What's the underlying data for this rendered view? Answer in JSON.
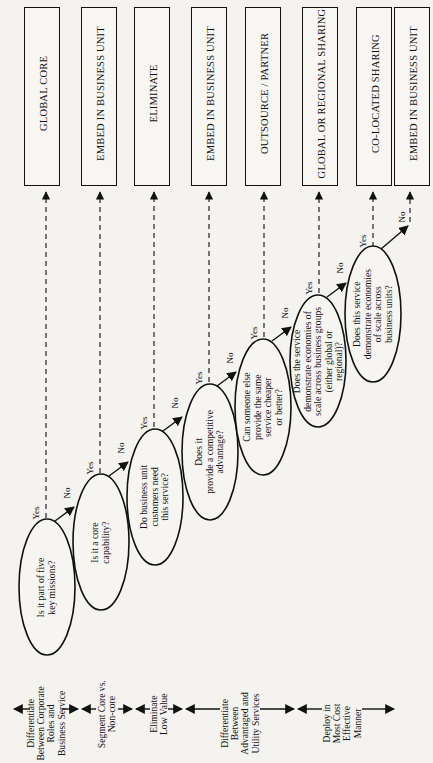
{
  "diagram": {
    "orientation": "rotated 90deg counter-clockwise",
    "outcomes": [
      {
        "id": "o1",
        "label": "GLOBAL CORE"
      },
      {
        "id": "o2",
        "label": "EMBED IN BUSINESS UNIT"
      },
      {
        "id": "o3",
        "label": "ELIMINATE"
      },
      {
        "id": "o4",
        "label": "EMBED IN BUSINESS UNIT"
      },
      {
        "id": "o5",
        "label": "OUTSOURCE / PARTNER"
      },
      {
        "id": "o6",
        "label": "GLOBAL OR REGIONAL SHARING"
      },
      {
        "id": "o7",
        "label": "CO-LOCATED SHARING"
      },
      {
        "id": "o8",
        "label": "EMBED IN BUSINESS UNIT"
      }
    ],
    "questions": [
      {
        "id": "q1",
        "lines": [
          "Is it part of five",
          "key missions?"
        ],
        "yes": "Yes",
        "no": "No"
      },
      {
        "id": "q2",
        "lines": [
          "Is it a core",
          "capability?"
        ],
        "yes": "Yes",
        "no": "No"
      },
      {
        "id": "q3",
        "lines": [
          "Do business unit",
          "customers need",
          "this service?"
        ],
        "yes": "Yes",
        "no": "No"
      },
      {
        "id": "q4",
        "lines": [
          "Does it",
          "provide a competitive",
          "advantage?"
        ],
        "yes": "Yes",
        "no": "No"
      },
      {
        "id": "q5",
        "lines": [
          "Can someone else",
          "provide the same",
          "service cheaper",
          "or better?"
        ],
        "yes": "Yes",
        "no": "No"
      },
      {
        "id": "q6",
        "lines": [
          "Does the service",
          "demonstrate economies of",
          "scale across business groups",
          "(either global or",
          "regional)?"
        ],
        "yes": "Yes",
        "no": "No"
      },
      {
        "id": "q7",
        "lines": [
          "Does this service",
          "demonstrate economies",
          "of scale across",
          "business units?"
        ],
        "yes": "Yes",
        "no": "No"
      }
    ],
    "phases": [
      {
        "id": "p1",
        "lines": [
          "Differentiate",
          "Between Corporate",
          "Roles and",
          "Business Service"
        ]
      },
      {
        "id": "p2",
        "lines": [
          "Segment Core vs.",
          "Non-core"
        ]
      },
      {
        "id": "p3",
        "lines": [
          "Eliminate",
          "Low Value"
        ]
      },
      {
        "id": "p4",
        "lines": [
          "Differentiate",
          "Between",
          "Advantaged and",
          "Utility Services"
        ]
      },
      {
        "id": "p5",
        "lines": [
          "Deploy in",
          "Most Cost",
          "Effective",
          "Manner"
        ]
      }
    ]
  }
}
